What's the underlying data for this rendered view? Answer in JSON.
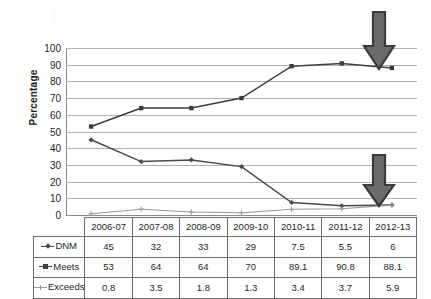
{
  "chart_data": {
    "type": "line",
    "title": "",
    "xlabel": "",
    "ylabel": "Percentage",
    "ylim": [
      0,
      100
    ],
    "ytick_step": 10,
    "yticks": [
      "100",
      "90",
      "80",
      "70",
      "60",
      "50",
      "40",
      "30",
      "20",
      "10",
      "0"
    ],
    "grid": true,
    "legend_position": "data-table-row-headers",
    "categories": [
      "2006-07",
      "2007-08",
      "2008-09",
      "2009-10",
      "2010-11",
      "2011-12",
      "2012-13"
    ],
    "series": [
      {
        "name": "DNM",
        "marker": "diamond",
        "color": "#4a4a4a",
        "values": [
          45,
          32,
          33,
          29,
          7.5,
          5.5,
          6
        ],
        "labels": [
          "45",
          "32",
          "33",
          "29",
          "7.5",
          "5.5",
          "6"
        ]
      },
      {
        "name": "Meets",
        "marker": "square",
        "color": "#3d3d3d",
        "values": [
          53,
          64,
          64,
          70,
          89.1,
          90.8,
          88.1
        ],
        "labels": [
          "53",
          "64",
          "64",
          "70",
          "89.1",
          "90.8",
          "88.1"
        ]
      },
      {
        "name": "Exceeds",
        "marker": "cross",
        "color": "#9a9a9a",
        "values": [
          0.8,
          3.5,
          1.8,
          1.3,
          3.4,
          3.7,
          5.9
        ],
        "labels": [
          "0.8",
          "3.5",
          "1.8",
          "1.3",
          "3.4",
          "3.7",
          "5.9"
        ]
      }
    ],
    "annotations": [
      {
        "name": "arrow-meets-2012-13",
        "shape": "down-arrow",
        "color": "#6b6b6b",
        "points_at_category": "2012-13",
        "points_at_series": "Meets",
        "points_at_value": 88.1
      },
      {
        "name": "arrow-exceeds-2012-13",
        "shape": "down-arrow",
        "color": "#6b6b6b",
        "points_at_category": "2012-13",
        "points_at_series": "Exceeds",
        "points_at_value": 5.9
      }
    ]
  },
  "colors": {
    "gridline": "#b0b0b0",
    "axis": "#8a8a8a",
    "table_border": "#6e6e6e",
    "text": "#231f20",
    "arrow_fill": "#6b6b6b",
    "arrow_stroke": "#3a3a3a",
    "background": "#ffffff"
  }
}
